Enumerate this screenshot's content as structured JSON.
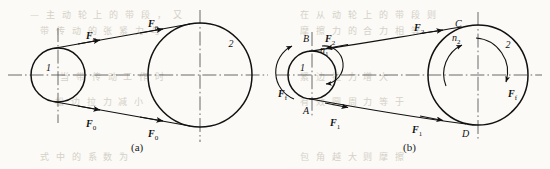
{
  "figure": {
    "panels": [
      {
        "id": "a",
        "caption": "(a)",
        "description": "Belt drive at rest with initial tension",
        "pulleys": [
          {
            "name": "driving-pulley",
            "label": "1",
            "cx": 58,
            "cy": 75,
            "r": 27
          },
          {
            "name": "driven-pulley",
            "label": "2",
            "cx": 200,
            "cy": 75,
            "r": 52
          }
        ],
        "force_labels": [
          {
            "name": "f0-top-left",
            "text": "F",
            "sub": "0",
            "x": 86,
            "y": 30
          },
          {
            "name": "f0-top-right",
            "text": "F",
            "sub": "0",
            "x": 148,
            "y": 18
          },
          {
            "name": "f0-bottom-left",
            "text": "F",
            "sub": "0",
            "x": 86,
            "y": 118
          },
          {
            "name": "f0-bottom-right",
            "text": "F",
            "sub": "0",
            "x": 148,
            "y": 128
          }
        ]
      },
      {
        "id": "b",
        "caption": "(b)",
        "description": "Belt drive in operation with tight and slack sides",
        "pulleys": [
          {
            "name": "driving-pulley",
            "label": "1",
            "cx": 312,
            "cy": 75,
            "r": 24
          },
          {
            "name": "driven-pulley",
            "label": "2",
            "cx": 478,
            "cy": 75,
            "r": 50
          }
        ],
        "speed_labels": [
          {
            "name": "n1-speed",
            "text": "n",
            "sub": "1",
            "x": 320,
            "y": 44
          },
          {
            "name": "n2-speed",
            "text": "n",
            "sub": "2",
            "x": 452,
            "y": 32
          }
        ],
        "point_labels": [
          {
            "name": "point-a",
            "text": "A",
            "x": 303,
            "y": 105
          },
          {
            "name": "point-b",
            "text": "B",
            "x": 303,
            "y": 33
          },
          {
            "name": "point-c",
            "text": "C",
            "x": 455,
            "y": 18
          },
          {
            "name": "point-d",
            "text": "D",
            "x": 462,
            "y": 128
          }
        ],
        "force_labels": [
          {
            "name": "f2-slack-near",
            "text": "F",
            "sub": "2",
            "x": 325,
            "y": 33
          },
          {
            "name": "f2-slack-far",
            "text": "F",
            "sub": "2",
            "x": 414,
            "y": 22
          },
          {
            "name": "f1-tight-near",
            "text": "F",
            "sub": "1",
            "x": 330,
            "y": 117
          },
          {
            "name": "f1-tight-far",
            "text": "F",
            "sub": "1",
            "x": 412,
            "y": 124
          },
          {
            "name": "ff-driving",
            "text": "F",
            "sub": "f",
            "x": 278,
            "y": 88
          },
          {
            "name": "ff-driven",
            "text": "F",
            "sub": "f",
            "x": 508,
            "y": 88
          }
        ]
      }
    ],
    "colors": {
      "ink": "#111111",
      "paper": "#fbfaf7",
      "centerline": "#5a5a5a",
      "bleed_text": "#cfcabe"
    }
  },
  "background_bleed": [
    {
      "text": "— 主 动 轮 上 的 带 段 ， 又",
      "x": 30,
      "y": 8
    },
    {
      "text": "在 从 动 轮 上 的 带 段 则",
      "x": 300,
      "y": 8
    },
    {
      "text": "带 传 动 的 张 紧 力 与",
      "x": 40,
      "y": 24
    },
    {
      "text": "摩 擦 力 的 合 力 相 等",
      "x": 300,
      "y": 24
    },
    {
      "text": "当 带 传 动 工 作 时",
      "x": 60,
      "y": 70
    },
    {
      "text": "紧 边 拉 力 增 大",
      "x": 300,
      "y": 70
    },
    {
      "text": "松 边 拉 力 减 小",
      "x": 55,
      "y": 95
    },
    {
      "text": "有 效 圆 周 力 等 于",
      "x": 300,
      "y": 95
    },
    {
      "text": "式 中 的 系 数 为",
      "x": 40,
      "y": 150
    },
    {
      "text": "包 角 越 大 则 摩 擦",
      "x": 300,
      "y": 150
    }
  ]
}
